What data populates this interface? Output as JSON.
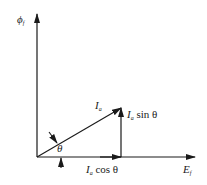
{
  "diagram": {
    "type": "phasor-diagram",
    "axes": {
      "vertical": {
        "symbol": "ϕ",
        "subscript": "f"
      },
      "horizontal": {
        "symbol": "E",
        "subscript": "f"
      }
    },
    "vectors": [
      {
        "name": "I_a",
        "symbol": "I",
        "subscript": "a"
      },
      {
        "name": "I_a sin θ",
        "symbol": "I",
        "subscript": "a",
        "suffix": " sin θ"
      },
      {
        "name": "I_a cos θ",
        "symbol": "I",
        "subscript": "a",
        "suffix": " cos θ"
      }
    ],
    "angle": {
      "symbol": "θ"
    }
  }
}
